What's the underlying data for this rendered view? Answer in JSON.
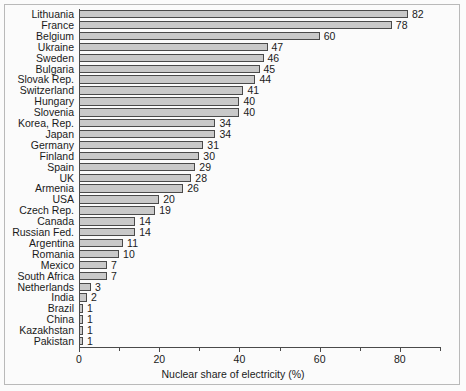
{
  "chart_data": {
    "type": "bar",
    "orientation": "horizontal",
    "title": "",
    "xlabel": "Nuclear share of electricity (%)",
    "ylabel": "",
    "xlim": [
      0,
      90
    ],
    "xticks": [
      0,
      20,
      40,
      60,
      80
    ],
    "xtick_labels": [
      "0",
      "20",
      "40",
      "60",
      "80"
    ],
    "minor_tick_step": 10,
    "grid": false,
    "legend": null,
    "bar_fill_color": "#c9c9c9",
    "bar_edge_color": "#4a4a4a",
    "background_color": "#fbfbfb",
    "categories": [
      "Lithuania",
      "France",
      "Belgium",
      "Ukraine",
      "Sweden",
      "Bulgaria",
      "Slovak Rep.",
      "Switzerland",
      "Hungary",
      "Slovenia",
      "Korea, Rep.",
      "Japan",
      "Germany",
      "Finland",
      "Spain",
      "UK",
      "Armenia",
      "USA",
      "Czech Rep.",
      "Canada",
      "Russian Fed.",
      "Argentina",
      "Romania",
      "Mexico",
      "South Africa",
      "Netherlands",
      "India",
      "Brazil",
      "China",
      "Kazakhstan",
      "Pakistan"
    ],
    "values": [
      82,
      78,
      60,
      47,
      46,
      45,
      44,
      41,
      40,
      40,
      34,
      34,
      31,
      30,
      29,
      28,
      26,
      20,
      19,
      14,
      14,
      11,
      10,
      7,
      7,
      3,
      2,
      1,
      1,
      1,
      1
    ],
    "value_labels": [
      "82",
      "78",
      "60",
      "47",
      "46",
      "45",
      "44",
      "41",
      "40",
      "40",
      "34",
      "34",
      "31",
      "30",
      "29",
      "28",
      "26",
      "20",
      "19",
      "14",
      "14",
      "11",
      "10",
      "7",
      "7",
      "3",
      "2",
      "1",
      "1",
      "1",
      "1"
    ]
  }
}
